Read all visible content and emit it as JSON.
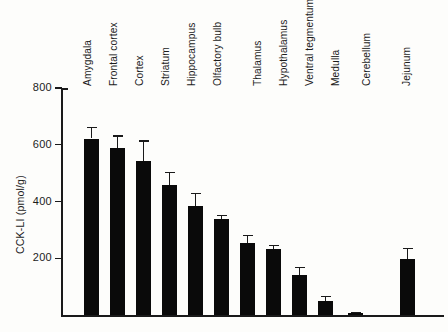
{
  "chart_data": {
    "type": "bar",
    "title": "",
    "xlabel": "",
    "ylabel": "CCK-LI (pmol/g)",
    "ylim": [
      0,
      800
    ],
    "yticks": [
      200,
      400,
      600,
      800
    ],
    "ytick_labels": [
      "200",
      "400",
      "600",
      "800"
    ],
    "grid": false,
    "legend": "none",
    "error_bars": "upper only (SEM)",
    "bar_color": "#0a0a0a",
    "axis_color": "#1a1a1a",
    "categories": [
      "Amygdala",
      "Frontal cortex",
      "Cortex",
      "Striatum",
      "Hippocampus",
      "Olfactory bulb",
      "Thalamus",
      "Hypothalamus",
      "Ventral tegmentum",
      "Medulla",
      "Cerebellum",
      "Jejunum"
    ],
    "values": [
      622,
      589,
      542,
      459,
      385,
      338,
      253,
      231,
      141,
      50,
      8,
      197
    ],
    "errors": [
      41,
      44,
      73,
      45,
      45,
      16,
      30,
      16,
      29,
      17,
      4,
      40
    ],
    "bars": [
      {
        "label": "Amygdala",
        "value": 622,
        "error": 41,
        "x": 84
      },
      {
        "label": "Frontal cortex",
        "value": 589,
        "error": 44,
        "x": 110
      },
      {
        "label": "Cortex",
        "value": 542,
        "error": 73,
        "x": 136
      },
      {
        "label": "Striatum",
        "value": 459,
        "error": 45,
        "x": 162
      },
      {
        "label": "Hippocampus",
        "value": 385,
        "error": 45,
        "x": 188
      },
      {
        "label": "Olfactory bulb",
        "value": 338,
        "error": 16,
        "x": 214
      },
      {
        "label": "Thalamus",
        "value": 253,
        "error": 30,
        "x": 240
      },
      {
        "label": "Hypothalamus",
        "value": 231,
        "error": 16,
        "x": 266
      },
      {
        "label": "Ventral tegmentum",
        "value": 141,
        "error": 29,
        "x": 292
      },
      {
        "label": "Medulla",
        "value": 50,
        "error": 17,
        "x": 318
      },
      {
        "label": "Cerebellum",
        "value": 8,
        "error": 4,
        "x": 348
      },
      {
        "label": "Jejunum",
        "value": 197,
        "error": 40,
        "x": 400
      }
    ],
    "label_positions": [
      {
        "text": "Amygdala",
        "x": 93
      },
      {
        "text": "Frontal cortex",
        "x": 119
      },
      {
        "text": "Cortex",
        "x": 145
      },
      {
        "text": "Striatum",
        "x": 171
      },
      {
        "text": "Hippocampus",
        "x": 197
      },
      {
        "text": "Olfactory bulb",
        "x": 223
      },
      {
        "text": "Thalamus",
        "x": 263
      },
      {
        "text": "Hypothalamus",
        "x": 289
      },
      {
        "text": "Ventral tegmentum",
        "x": 315
      },
      {
        "text": "Medulla",
        "x": 341
      },
      {
        "text": "Cerebellum",
        "x": 372
      },
      {
        "text": "Jejunum",
        "x": 412
      }
    ]
  }
}
